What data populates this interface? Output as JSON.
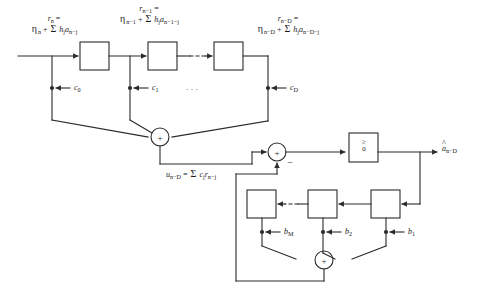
{
  "diagram": {
    "line_color": "#2b2b2b",
    "background_color": "#ffffff",
    "forward_path": {
      "input_label": {
        "line1": "r_n =",
        "line2": "η_n + Σ h_j a_{n-j}"
      },
      "tap2_label": {
        "line1": "r_{n-1} =",
        "line2": "η_{n-1} + Σ h_j a_{n-1-j}"
      },
      "tapD_label": {
        "line1": "r_{n-D} =",
        "line2": "η_{n-D} + Σ h_j a_{n-D-j}"
      },
      "delay_boxes": [
        "delay-1",
        "delay-2",
        "delay-3"
      ],
      "ellipsis": "······",
      "tap_dots": "···",
      "coefficients": [
        "c0",
        "c1",
        "cD"
      ],
      "coefficient_labels": [
        "c",
        "c",
        "c"
      ],
      "coefficient_subs": [
        "0",
        "1",
        "D"
      ]
    },
    "summer1": {
      "sign": "+"
    },
    "summer2": {
      "sign": "+",
      "minus_sign": "−"
    },
    "summer3": {
      "sign": "+"
    },
    "feedforward_output_label": "u_{n-D} = Σ c_j r_{n-j}",
    "decision_device": {
      "name": "threshold-detector",
      "symbol_top": "≥",
      "symbol_bottom": "0"
    },
    "output_label": {
      "hat": "^",
      "base": "a",
      "sub": "n−D"
    },
    "feedback_path": {
      "delay_boxes": [
        "fb-delay-M",
        "fb-delay-2",
        "fb-delay-1"
      ],
      "ellipsis": "····",
      "coefficient_labels": [
        "b",
        "b",
        "b"
      ],
      "coefficient_subs": [
        "M",
        "2",
        "1"
      ]
    },
    "greek": {
      "eta": "η",
      "sigma": "Σ"
    }
  }
}
